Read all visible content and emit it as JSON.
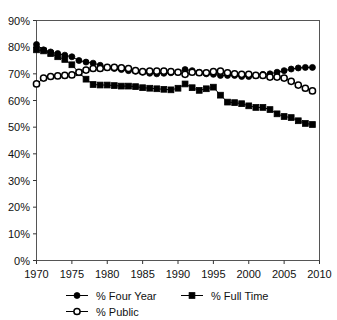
{
  "chart_data": {
    "type": "line",
    "title": "",
    "subtitle": "",
    "xlabel": "",
    "ylabel": "",
    "xlim": [
      1970,
      2010
    ],
    "ylim": [
      0,
      90
    ],
    "grid": false,
    "legend_position": "bottom",
    "y_ticks": [
      0,
      10,
      20,
      30,
      40,
      50,
      60,
      70,
      80,
      90
    ],
    "y_tick_labels": [
      "0%",
      "10%",
      "20%",
      "30%",
      "40%",
      "50%",
      "60%",
      "70%",
      "80%",
      "90%"
    ],
    "x_ticks": [
      1970,
      1975,
      1980,
      1985,
      1990,
      1995,
      2000,
      2005,
      2010
    ],
    "x_tick_labels": [
      "1970",
      "1975",
      "1980",
      "1985",
      "1990",
      "1995",
      "2000",
      "2005",
      "2010"
    ],
    "x": [
      1970,
      1971,
      1972,
      1973,
      1974,
      1975,
      1976,
      1977,
      1978,
      1979,
      1980,
      1981,
      1982,
      1983,
      1984,
      1985,
      1986,
      1987,
      1988,
      1989,
      1990,
      1991,
      1992,
      1993,
      1994,
      1995,
      1996,
      1997,
      1998,
      1999,
      2000,
      2001,
      2002,
      2003,
      2004,
      2005,
      2006,
      2007,
      2008,
      2009
    ],
    "series": [
      {
        "name": "% Four Year",
        "marker": "filled-circle",
        "color": "#000000",
        "values": [
          81.0,
          79.0,
          78.2,
          77.6,
          77.0,
          76.4,
          75.0,
          74.4,
          74.0,
          73.2,
          72.4,
          72.0,
          71.6,
          71.2,
          71.0,
          70.6,
          70.2,
          70.0,
          70.2,
          70.4,
          70.6,
          71.6,
          71.2,
          70.6,
          70.0,
          69.8,
          69.4,
          69.4,
          69.4,
          69.0,
          69.0,
          69.4,
          69.8,
          70.0,
          70.6,
          71.2,
          71.8,
          72.2,
          72.4,
          72.4
        ]
      },
      {
        "name": "% Full Time",
        "marker": "filled-square",
        "color": "#000000",
        "values": [
          79.0,
          78.6,
          77.6,
          76.4,
          75.4,
          73.4,
          70.4,
          68.0,
          66.0,
          65.8,
          65.8,
          65.6,
          65.4,
          65.4,
          65.2,
          64.8,
          64.6,
          64.4,
          64.2,
          64.0,
          64.6,
          66.2,
          64.8,
          63.8,
          64.4,
          65.0,
          62.0,
          59.4,
          59.2,
          58.8,
          58.0,
          57.4,
          57.4,
          56.6,
          55.0,
          54.0,
          53.6,
          52.4,
          51.4,
          51.0
        ]
      },
      {
        "name": "% Public",
        "marker": "open-circle",
        "color": "#000000",
        "values": [
          66.2,
          68.4,
          69.0,
          69.2,
          69.4,
          69.6,
          70.6,
          71.4,
          72.0,
          72.0,
          72.4,
          72.4,
          72.2,
          72.0,
          71.2,
          70.8,
          71.0,
          71.0,
          71.0,
          70.8,
          70.6,
          69.8,
          70.6,
          70.4,
          70.4,
          70.8,
          71.0,
          70.4,
          70.0,
          69.8,
          69.8,
          69.4,
          69.4,
          68.8,
          68.8,
          68.4,
          67.2,
          65.8,
          64.6,
          63.6
        ]
      }
    ],
    "legend": [
      {
        "label": "% Four Year",
        "marker": "filled-circle"
      },
      {
        "label": "% Full Time",
        "marker": "filled-square"
      },
      {
        "label": "% Public",
        "marker": "open-circle"
      }
    ]
  }
}
